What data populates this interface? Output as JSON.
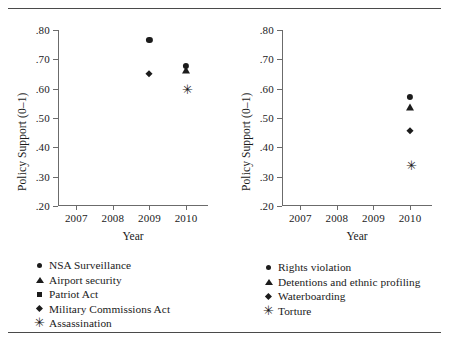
{
  "figure": {
    "title_fragment": "",
    "xlabel": "Year",
    "ylabel": "Policy Support (0–1)"
  },
  "chart_data": [
    {
      "type": "scatter",
      "panel": "left",
      "title": "",
      "xlabel": "Year",
      "ylabel": "Policy Support (0–1)",
      "xlim": [
        2006.5,
        2010.6
      ],
      "ylim": [
        0.2,
        0.8
      ],
      "xticks": [
        "2007",
        "2008",
        "2009",
        "2010"
      ],
      "xtick_values": [
        2007,
        2008,
        2009,
        2010
      ],
      "yticks": [
        ".20",
        ".30",
        ".40",
        ".50",
        ".60",
        ".70",
        ".80"
      ],
      "ytick_values": [
        0.2,
        0.3,
        0.4,
        0.5,
        0.6,
        0.7,
        0.8
      ],
      "grid": false,
      "legend_position": "below",
      "series": [
        {
          "name": "NSA Surveillance",
          "marker": "circle",
          "points": [
            {
              "x": 2009,
              "y": 0.765
            }
          ]
        },
        {
          "name": "Airport security",
          "marker": "triangle",
          "points": [
            {
              "x": 2010,
              "y": 0.665
            }
          ]
        },
        {
          "name": "Patriot Act",
          "marker": "square",
          "points": []
        },
        {
          "name": "Military Commissions Act",
          "marker": "diamond",
          "points": [
            {
              "x": 2009,
              "y": 0.65
            }
          ]
        },
        {
          "name": "Assassination",
          "marker": "asterisk",
          "points": [
            {
              "x": 2010,
              "y": 0.6
            }
          ]
        },
        {
          "name": "Unlabeled 2010 circle",
          "marker": "circle",
          "points": [
            {
              "x": 2010,
              "y": 0.678
            }
          ]
        }
      ]
    },
    {
      "type": "scatter",
      "panel": "right",
      "title": "",
      "xlabel": "Year",
      "ylabel": "Policy Support (0–1)",
      "xlim": [
        2006.5,
        2010.6
      ],
      "ylim": [
        0.2,
        0.8
      ],
      "xticks": [
        "2007",
        "2008",
        "2009",
        "2010"
      ],
      "xtick_values": [
        2007,
        2008,
        2009,
        2010
      ],
      "yticks": [
        ".20",
        ".30",
        ".40",
        ".50",
        ".60",
        ".70",
        ".80"
      ],
      "ytick_values": [
        0.2,
        0.3,
        0.4,
        0.5,
        0.6,
        0.7,
        0.8
      ],
      "grid": false,
      "legend_position": "below",
      "series": [
        {
          "name": "Rights violation",
          "marker": "circle",
          "points": [
            {
              "x": 2010,
              "y": 0.572
            }
          ]
        },
        {
          "name": "Detentions and ethnic profiling",
          "marker": "triangle",
          "points": [
            {
              "x": 2010,
              "y": 0.538
            }
          ]
        },
        {
          "name": "Waterboarding",
          "marker": "diamond",
          "points": [
            {
              "x": 2010,
              "y": 0.455
            }
          ]
        },
        {
          "name": "Torture",
          "marker": "asterisk",
          "points": [
            {
              "x": 2010,
              "y": 0.34
            }
          ]
        }
      ]
    }
  ],
  "legends": {
    "left": [
      {
        "marker": "circle",
        "label": "NSA Surveillance"
      },
      {
        "marker": "triangle",
        "label": "Airport security"
      },
      {
        "marker": "square",
        "label": "Patriot Act"
      },
      {
        "marker": "diamond",
        "label": "Military Commissions Act"
      },
      {
        "marker": "asterisk",
        "label": "Assassination"
      }
    ],
    "right": [
      {
        "marker": "circle",
        "label": "Rights violation"
      },
      {
        "marker": "triangle",
        "label": "Detentions and ethnic profiling"
      },
      {
        "marker": "diamond",
        "label": "Waterboarding"
      },
      {
        "marker": "asterisk",
        "label": "Torture"
      }
    ]
  },
  "axis_labels": {
    "y": [
      ".80",
      ".70",
      ".60",
      ".50",
      ".40",
      ".30",
      ".20"
    ],
    "x": [
      "2007",
      "2008",
      "2009",
      "2010"
    ]
  },
  "marker_glyphs": {
    "asterisk": "✳"
  }
}
